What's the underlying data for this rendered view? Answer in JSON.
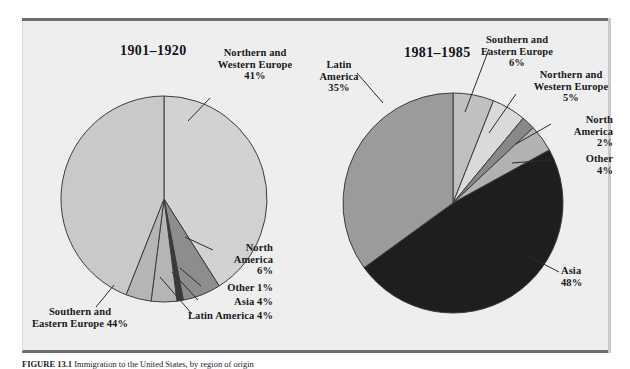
{
  "figure": {
    "caption_label": "FIGURE 13.1",
    "caption_text": "Immigration to the United States, by region of origin",
    "background": "#eeeeee",
    "rule_color": "#6e6e72"
  },
  "charts": [
    {
      "id": "chart-1901-1920",
      "title": "1901–1920",
      "center": [
        163,
        198
      ],
      "radius": 103
    },
    {
      "id": "chart-1981-1985",
      "title": "1981–1985",
      "center": [
        447,
        197
      ],
      "radius": 110
    }
  ],
  "chart_data": [
    {
      "type": "pie",
      "title": "1901–1920",
      "xlabel": "",
      "ylabel": "",
      "legend": "none",
      "categories": [
        "Northern and Western Europe",
        "North America",
        "Other",
        "Asia",
        "Latin America",
        "Southern and Eastern Europe"
      ],
      "values": [
        41,
        6,
        1,
        4,
        4,
        44
      ],
      "labels": [
        "Northern and\nWestern Europe\n41%",
        "North\nAmerica\n6%",
        "Other 1%",
        "Asia 4%",
        "Latin America 4%",
        "Southern and\nEastern Europe 44%"
      ],
      "colors": [
        "#d2d2d2",
        "#8d8d8d",
        "#3a3a3a",
        "#b5b5b5",
        "#b5b5b5",
        "#c9c9c9"
      ],
      "start_angle_deg": -90,
      "direction": "clockwise",
      "total": 100
    },
    {
      "type": "pie",
      "title": "1981–1985",
      "xlabel": "",
      "ylabel": "",
      "legend": "none",
      "categories": [
        "Southern and Eastern Europe",
        "Northern and Western Europe",
        "North America",
        "Other",
        "Asia",
        "Latin America"
      ],
      "values": [
        6,
        5,
        2,
        4,
        48,
        35
      ],
      "labels": [
        "Southern and\nEastern Europe\n6%",
        "Northern and\nWestern Europe\n5%",
        "North\nAmerica\n2%",
        "Other\n4%",
        "Asia\n48%",
        "Latin\nAmerica\n35%"
      ],
      "colors": [
        "#c0c0c0",
        "#dadada",
        "#888888",
        "#b2b2b2",
        "#1e1e1e",
        "#9b9b9b"
      ],
      "start_angle_deg": -90,
      "direction": "clockwise",
      "total": 100
    }
  ],
  "labels_left": {
    "title": "1901–1920",
    "nwe": "Northern and\nWestern Europe\n41%",
    "nwe_l1": "Northern and",
    "nwe_l2": "Western Europe",
    "nwe_l3": "41%",
    "na_l1": "North",
    "na_l2": "America",
    "na_l3": "6%",
    "other": "Other 1%",
    "asia": "Asia 4%",
    "latin": "Latin America 4%",
    "see_l1": "Southern and",
    "see_l2": "Eastern Europe 44%"
  },
  "labels_right": {
    "title": "1981–1985",
    "latin_l1": "Latin",
    "latin_l2": "America",
    "latin_l3": "35%",
    "see_l1": "Southern and",
    "see_l2": "Eastern Europe",
    "see_l3": "6%",
    "nwe_l1": "Northern and",
    "nwe_l2": "Western Europe",
    "nwe_l3": "5%",
    "na_l1": "North",
    "na_l2": "America",
    "na_l3": "2%",
    "other_l1": "Other",
    "other_l2": "4%",
    "asia_l1": "Asia",
    "asia_l2": "48%"
  }
}
